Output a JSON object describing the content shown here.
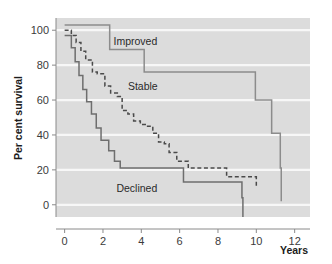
{
  "chart_data": {
    "type": "line",
    "title": "",
    "subtitle": "",
    "xlabel": "Years",
    "ylabel": "Per cent survival",
    "xlim": [
      -0.45,
      12.8
    ],
    "ylim": [
      -7,
      107
    ],
    "xticks": [
      0,
      2,
      4,
      6,
      8,
      10,
      12
    ],
    "xtick_labels": [
      "0",
      "2",
      "4",
      "6",
      "8",
      "10",
      "12"
    ],
    "yticks": [
      0,
      20,
      40,
      60,
      80,
      100
    ],
    "ytick_labels": [
      "0",
      "20",
      "40",
      "60",
      "80",
      "100"
    ],
    "grid": "horizontal-white-gridlines",
    "legend": "inline-series-labels",
    "plot_background": "#dcdcdc",
    "gridline_color": "#f7f7f7",
    "series": [
      {
        "name": "Improved",
        "style": "solid",
        "color": "#8c8c8c",
        "label_x": 2.55,
        "label_y": 91.5,
        "step": "post",
        "x": [
          0.0,
          2.35,
          4.15,
          9.95,
          10.8,
          11.25,
          11.3
        ],
        "y": [
          103,
          89,
          76,
          60,
          41,
          21,
          2
        ]
      },
      {
        "name": "Stable",
        "style": "dashed",
        "color": "#4a4a4a",
        "label_x": 3.3,
        "label_y": 65.5,
        "step": "post",
        "x": [
          0.0,
          0.35,
          0.6,
          0.85,
          1.1,
          1.45,
          1.7,
          2.1,
          2.4,
          2.75,
          3.0,
          3.3,
          3.6,
          3.95,
          4.25,
          4.6,
          4.9,
          5.2,
          5.45,
          5.85,
          6.45,
          8.45,
          10.0
        ],
        "y": [
          100,
          97,
          93,
          88,
          83,
          76,
          75,
          68,
          64,
          62,
          54,
          52,
          48,
          46,
          45,
          41,
          36,
          35,
          30,
          25,
          21,
          16,
          10
        ]
      },
      {
        "name": "Declined",
        "style": "solid",
        "color": "#6e6e6e",
        "label_x": 2.7,
        "label_y": 7.5,
        "step": "post",
        "x": [
          0.0,
          0.35,
          0.55,
          0.75,
          0.95,
          1.15,
          1.4,
          1.65,
          1.9,
          2.3,
          2.6,
          2.9,
          6.2,
          9.25,
          9.3
        ],
        "y": [
          97,
          90,
          82,
          74,
          66,
          59,
          52,
          44,
          37,
          31,
          25,
          21,
          13,
          4,
          -7
        ]
      }
    ],
    "annotations": [
      {
        "text": "Improved",
        "x": 2.55,
        "y": 91.5
      },
      {
        "text": "Stable",
        "x": 3.3,
        "y": 65.5
      },
      {
        "text": "Declined",
        "x": 2.7,
        "y": 7.5
      }
    ]
  },
  "axes": {
    "y_title": "Per cent survival",
    "x_title": "Years"
  }
}
